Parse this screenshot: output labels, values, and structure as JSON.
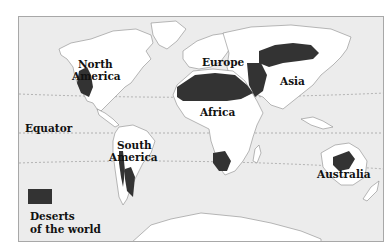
{
  "map": {
    "title": "Deserts of the world",
    "colors": {
      "ocean": "#ececec",
      "land": "#ffffff",
      "desert": "#333333",
      "coastline": "#8a8a8a",
      "latitude_line": "#9a9a9a"
    },
    "labels": {
      "north_america_1": "North",
      "north_america_2": "America",
      "europe": "Europe",
      "asia": "Asia",
      "africa": "Africa",
      "equator": "Equator",
      "south_america_1": "South",
      "south_america_2": "America",
      "australia": "Australia"
    },
    "legend": {
      "line1": "Deserts",
      "line2": "of the world"
    }
  }
}
